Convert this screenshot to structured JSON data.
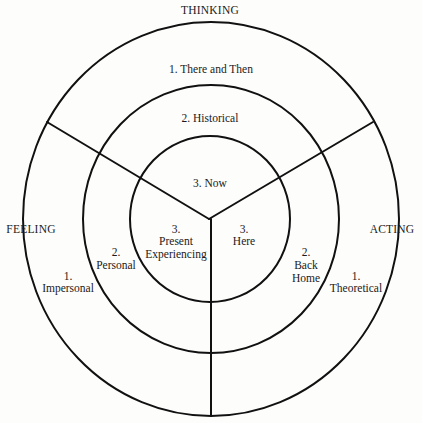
{
  "diagram": {
    "axes": {
      "top": "THINKING",
      "left": "FEELING",
      "right": "ACTING"
    },
    "thinking": {
      "ring1": "1.  There and Then",
      "ring2": "2.  Historical",
      "ring3": "3.  Now"
    },
    "feeling": {
      "ring1": [
        "1.",
        "Impersonal"
      ],
      "ring2": [
        "2.",
        "Personal"
      ],
      "ring3": [
        "3.",
        "Present",
        "Experiencing"
      ]
    },
    "acting": {
      "ring1": [
        "1.",
        "Theoretical"
      ],
      "ring2": [
        "2.",
        "Back",
        "Home"
      ],
      "ring3": [
        "3.",
        "Here"
      ]
    },
    "colors": {
      "line": "#111111",
      "text": "#1a1a1a",
      "background": "#fdfdfc"
    }
  }
}
